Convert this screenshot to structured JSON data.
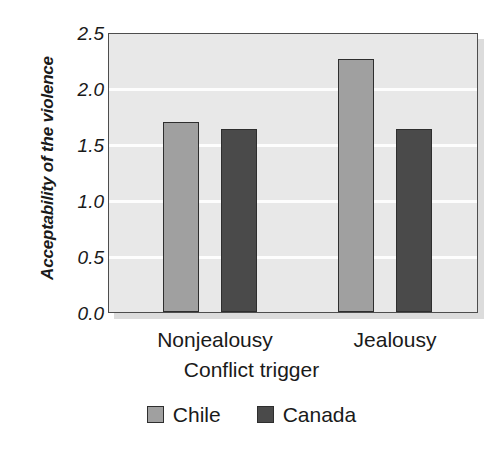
{
  "chart_data": {
    "type": "bar",
    "title": "",
    "subtitle": "",
    "xlabel": "Conflict trigger",
    "ylabel": "Acceptability of the violence",
    "categories": [
      "Nonjealousy",
      "Jealousy"
    ],
    "series": [
      {
        "name": "Chile",
        "values": [
          1.7,
          2.26
        ],
        "color": "#a0a0a0"
      },
      {
        "name": "Canada",
        "values": [
          1.63,
          1.63
        ],
        "color": "#4a4a4a"
      }
    ],
    "ylim": [
      0.0,
      2.5
    ],
    "ytick_labels": [
      "2.5",
      "2.0",
      "1.5",
      "1.0",
      "0.5",
      "0.0"
    ],
    "ytick_values": [
      2.5,
      2.0,
      1.5,
      1.0,
      0.5,
      0.0
    ],
    "grid": true,
    "grid_color": "#ffffff",
    "legend_position": "bottom",
    "plot_background": "#e8e8e8",
    "axis_color": "#4d4d4d"
  },
  "axes": {
    "y_title": "Acceptability of the violence",
    "x_title": "Conflict trigger",
    "ytick_0": "2.5",
    "ytick_1": "2.0",
    "ytick_2": "1.5",
    "ytick_3": "1.0",
    "ytick_4": "0.5",
    "ytick_5": "0.0",
    "xcat_0": "Nonjealousy",
    "xcat_1": "Jealousy"
  },
  "legend": {
    "item_0_label": "Chile",
    "item_1_label": "Canada"
  }
}
